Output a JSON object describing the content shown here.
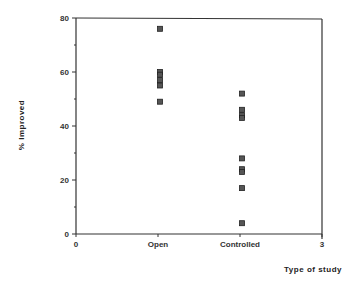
{
  "chart_data": {
    "type": "scatter",
    "title": "",
    "xlabel": "Type of study",
    "ylabel": "% Improved",
    "xlim": [
      0,
      3
    ],
    "ylim": [
      0,
      80
    ],
    "x_ticks": [
      {
        "value": 0,
        "label": "0"
      },
      {
        "value": 1,
        "label": "Open"
      },
      {
        "value": 2,
        "label": "Controlled"
      },
      {
        "value": 3,
        "label": "3"
      }
    ],
    "y_ticks": [
      0,
      20,
      40,
      60,
      80
    ],
    "y_minor_ticks": [
      10,
      30,
      50,
      70
    ],
    "grid": false,
    "legend": null,
    "marker": "square",
    "series": [
      {
        "name": "Open",
        "x": 1,
        "values": [
          76,
          60,
          59,
          57,
          55,
          49
        ]
      },
      {
        "name": "Controlled",
        "x": 2,
        "values": [
          52,
          46,
          44,
          43,
          28,
          24,
          23,
          17,
          4
        ]
      }
    ]
  }
}
